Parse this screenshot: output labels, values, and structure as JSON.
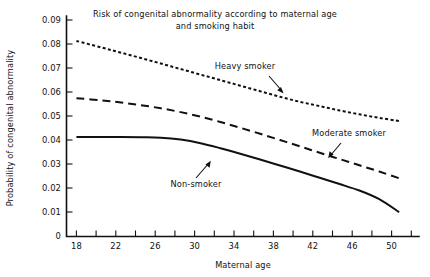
{
  "chart_data": {
    "type": "line",
    "title": "Risk of congenital abnormality according to maternal age and smoking habit",
    "title_line1": "Risk of congenital abnormality according to maternal age",
    "title_line2": "and smoking habit",
    "xlabel": "Maternal age",
    "ylabel": "Probability of congenital abnormality",
    "xlim": [
      16.5,
      52.0
    ],
    "ylim": [
      0,
      0.09
    ],
    "grid": false,
    "legend_position": "inline-annotations",
    "x_ticks_major": [
      18,
      22,
      26,
      30,
      34,
      38,
      42,
      46,
      50
    ],
    "x_tick_labels": [
      "18",
      "22",
      "26",
      "30",
      "34",
      "38",
      "42",
      "46",
      "50"
    ],
    "x_ticks_minor": [
      20,
      24,
      28,
      32,
      36,
      40,
      44,
      48,
      52
    ],
    "y_ticks": [
      0,
      0.01,
      0.02,
      0.03,
      0.04,
      0.05,
      0.06,
      0.07,
      0.08,
      0.09
    ],
    "y_tick_labels": [
      "0",
      "0.01",
      "0.02",
      "0.03",
      "0.04",
      "0.05",
      "0.06",
      "0.07",
      "0.08",
      "0.09"
    ],
    "x": [
      17.5,
      20,
      22,
      24,
      26,
      28,
      30,
      32,
      34,
      36,
      38,
      40,
      42,
      44,
      46,
      48,
      50
    ],
    "series": [
      {
        "name": "Heavy smoker",
        "style": "dotted",
        "values": [
          0.0813,
          0.0786,
          0.0764,
          0.0742,
          0.0719,
          0.0696,
          0.0673,
          0.065,
          0.0627,
          0.0604,
          0.0581,
          0.056,
          0.0542,
          0.0524,
          0.0508,
          0.0493,
          0.048
        ]
      },
      {
        "name": "Moderate smoker",
        "style": "dashed",
        "values": [
          0.0575,
          0.0566,
          0.0557,
          0.0546,
          0.0533,
          0.0517,
          0.0498,
          0.0476,
          0.0452,
          0.0427,
          0.0401,
          0.0375,
          0.0348,
          0.0322,
          0.0296,
          0.027,
          0.0242
        ]
      },
      {
        "name": "Non-smoker",
        "style": "solid",
        "values": [
          0.0414,
          0.0414,
          0.0414,
          0.0413,
          0.0411,
          0.0403,
          0.0388,
          0.0367,
          0.0344,
          0.032,
          0.0295,
          0.027,
          0.0244,
          0.0218,
          0.0191,
          0.0155,
          0.0101
        ]
      }
    ],
    "annotations": [
      {
        "text": "Heavy smoker",
        "x_px": 245,
        "y_px": 66
      },
      {
        "text": "Moderate smoker",
        "x_px": 320,
        "y_px": 133
      },
      {
        "text": "Non-smoker",
        "x_px": 168,
        "y_px": 184
      }
    ]
  }
}
